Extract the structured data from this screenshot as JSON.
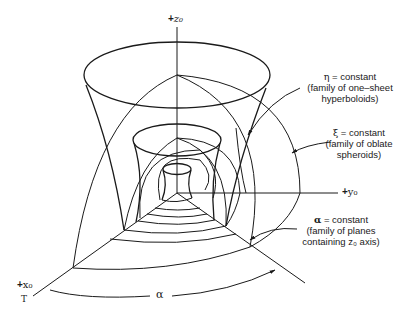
{
  "axes": {
    "z": {
      "sign": "+",
      "name": "z₀"
    },
    "y": {
      "sign": "+",
      "name": "y₀"
    },
    "x": {
      "sign": "+",
      "name": "x₀"
    }
  },
  "angle_label": "α",
  "small_mark": "T",
  "annotations": [
    {
      "symbol": "η",
      "line1": " = constant",
      "line2": "(family of one–sheet",
      "line3": "hyperboloids)"
    },
    {
      "symbol": "ξ",
      "line1": " = constant",
      "line2": "(family of oblate",
      "line3": "spheroids)"
    },
    {
      "symbol": "α",
      "line1": " = constant",
      "line2": "(family of planes",
      "line3": "containing z₀ axis)"
    }
  ]
}
